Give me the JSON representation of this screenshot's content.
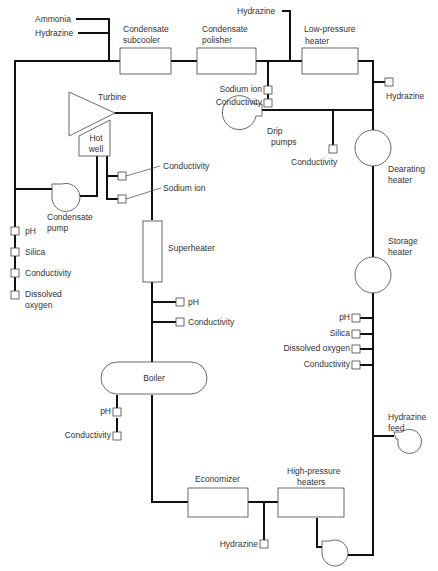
{
  "diagram": {
    "type": "process-flow",
    "chemical_feeds": {
      "top_left_1": "Ammonia",
      "top_left_2": "Hydrazine",
      "top_mid": "Hydrazine",
      "lp_heater_out": "Hydrazine",
      "economizer_in": "Hydrazine",
      "hydrazine_feed_1": "Hydrazine",
      "hydrazine_feed_2": "feed"
    },
    "components": {
      "condensate_subcooler": [
        "Condensate",
        "subcooler"
      ],
      "condensate_polisher": [
        "Condensate",
        "polisher"
      ],
      "low_pressure_heater": [
        "Low-pressure",
        "heater"
      ],
      "turbine": "Turbine",
      "hot_well": [
        "Hot",
        "well"
      ],
      "condensate_pump": [
        "Condensate",
        "pump"
      ],
      "drip_pumps": [
        "Drip",
        "pumps"
      ],
      "deaerating_heater": [
        "Dearating",
        "heater"
      ],
      "storage_heater": [
        "Storage",
        "heater"
      ],
      "superheater": "Superheater",
      "boiler": "Boiler",
      "economizer": "Economizer",
      "high_pressure_heaters": [
        "High-pressure",
        "heaters"
      ]
    },
    "sample_points": {
      "polisher_outlet": [
        "Sodium ion",
        "Conductivity"
      ],
      "hot_well": [
        "Conductivity",
        "Sodium ion"
      ],
      "condensate_pump_discharge": [
        "pH",
        "Silica",
        "Conductivity",
        "Dissolved",
        "oxygen"
      ],
      "drip_pumps": "Conductivity",
      "superheater_outlet": [
        "pH",
        "Conductivity"
      ],
      "storage_heater_outlet": [
        "pH",
        "Silica",
        "Dissolved oxygen",
        "Conductivity"
      ],
      "boiler_blowdown": [
        "pH",
        "Conductivity"
      ]
    }
  }
}
